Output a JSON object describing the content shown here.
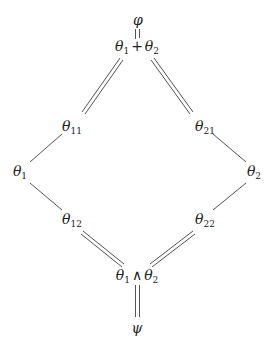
{
  "diagram": {
    "type": "lattice",
    "line_color": "#555555",
    "nodes": {
      "top": {
        "label": "φ"
      },
      "sum": {
        "a": "θ",
        "a_sub": "1",
        "op": "+",
        "b": "θ",
        "b_sub": "2"
      },
      "n11": {
        "label": "θ",
        "sub": "11"
      },
      "n21": {
        "label": "θ",
        "sub": "21"
      },
      "n1": {
        "label": "θ",
        "sub": "1"
      },
      "n2": {
        "label": "θ",
        "sub": "2"
      },
      "n12": {
        "label": "θ",
        "sub": "12"
      },
      "n22": {
        "label": "θ",
        "sub": "22"
      },
      "meet": {
        "a": "θ",
        "a_sub": "1",
        "op": "∧",
        "b": "θ",
        "b_sub": "2"
      },
      "bottom": {
        "label": "ψ"
      }
    },
    "edges": [
      {
        "from": "top",
        "to": "sum",
        "style": "double"
      },
      {
        "from": "sum",
        "to": "n11",
        "style": "double"
      },
      {
        "from": "sum",
        "to": "n21",
        "style": "double"
      },
      {
        "from": "n11",
        "to": "n1",
        "style": "single"
      },
      {
        "from": "n21",
        "to": "n2",
        "style": "single"
      },
      {
        "from": "n1",
        "to": "n12",
        "style": "single"
      },
      {
        "from": "n2",
        "to": "n22",
        "style": "single"
      },
      {
        "from": "n12",
        "to": "meet",
        "style": "double"
      },
      {
        "from": "n22",
        "to": "meet",
        "style": "double"
      },
      {
        "from": "meet",
        "to": "bottom",
        "style": "double"
      }
    ]
  }
}
